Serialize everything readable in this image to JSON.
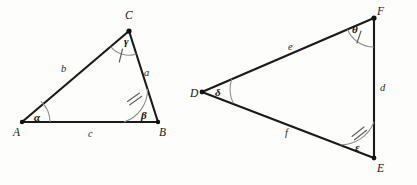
{
  "figure": {
    "background_color": "#fdfdfc",
    "line_color": "#1a1a1a",
    "arc_color": "#8d8d8d"
  },
  "triangle_left": {
    "name": "Triangle ABC",
    "vertices": [
      {
        "label": "A",
        "x": 22,
        "y": 122,
        "label_x": 13,
        "label_y": 127
      },
      {
        "label": "B",
        "x": 158,
        "y": 122,
        "label_x": 159,
        "label_y": 127
      },
      {
        "label": "C",
        "x": 129,
        "y": 31,
        "label_x": 125,
        "label_y": 10
      }
    ],
    "sides": [
      {
        "label": "a",
        "from": "C",
        "to": "B",
        "label_x": 144,
        "label_y": 68
      },
      {
        "label": "b",
        "from": "A",
        "to": "C",
        "label_x": 61,
        "label_y": 64
      },
      {
        "label": "c",
        "from": "A",
        "to": "B",
        "label_x": 88,
        "label_y": 129
      }
    ],
    "angles": [
      {
        "label": "α",
        "at": "A",
        "ticks": 0,
        "label_x": 34,
        "label_y": 112
      },
      {
        "label": "β",
        "at": "B",
        "ticks": 2,
        "label_x": 141,
        "label_y": 110
      },
      {
        "label": "γ",
        "at": "C",
        "ticks": 1,
        "label_x": 124,
        "label_y": 36
      }
    ]
  },
  "triangle_right": {
    "name": "Triangle DEF",
    "vertices": [
      {
        "label": "D",
        "x": 202,
        "y": 92,
        "label_x": 190,
        "label_y": 88
      },
      {
        "label": "E",
        "x": 374,
        "y": 158,
        "label_x": 377,
        "label_y": 163
      },
      {
        "label": "F",
        "x": 374,
        "y": 18,
        "label_x": 377,
        "label_y": 6
      }
    ],
    "sides": [
      {
        "label": "d",
        "from": "F",
        "to": "E",
        "label_x": 380,
        "label_y": 83
      },
      {
        "label": "e",
        "from": "D",
        "to": "F",
        "label_x": 288,
        "label_y": 42
      },
      {
        "label": "f",
        "from": "D",
        "to": "E",
        "label_x": 285,
        "label_y": 128
      }
    ],
    "angles": [
      {
        "label": "δ",
        "at": "D",
        "ticks": 0,
        "label_x": 215,
        "label_y": 87
      },
      {
        "label": "ε",
        "at": "E",
        "ticks": 2,
        "label_x": 355,
        "label_y": 142
      },
      {
        "label": "θ",
        "at": "F",
        "ticks": 1,
        "label_x": 352,
        "label_y": 24
      }
    ]
  }
}
